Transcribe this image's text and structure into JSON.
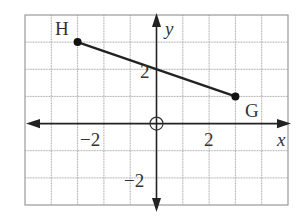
{
  "diagram": {
    "type": "coordinate-plane",
    "grid": {
      "x_min": -5,
      "x_max": 5,
      "y_min": -3,
      "y_max": 4,
      "step": 1
    },
    "axes": {
      "x_label": "x",
      "y_label": "y"
    },
    "tick_labels": {
      "x_neg": "−2",
      "x_pos": "2",
      "y_pos": "2",
      "y_neg": "−2"
    },
    "points": [
      {
        "name": "H",
        "x": -3,
        "y": 3
      },
      {
        "name": "G",
        "x": 3,
        "y": 1
      }
    ],
    "segment": {
      "from": "H",
      "to": "G"
    },
    "colors": {
      "grid": "#a8a8a8",
      "ink": "#222222"
    }
  }
}
